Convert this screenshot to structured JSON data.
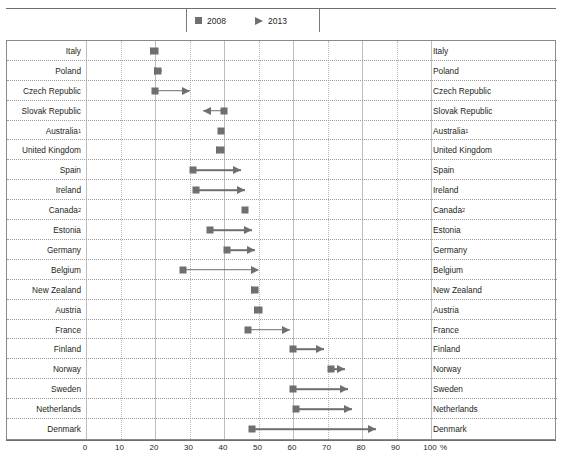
{
  "title": "",
  "legend": {
    "items": [
      {
        "label": "2008",
        "marker": "square-marker",
        "color": "#6f6f6f"
      },
      {
        "label": "2013",
        "marker": "triangle-marker",
        "color": "#6f6f6f"
      }
    ]
  },
  "axis": {
    "unit_label": "%",
    "ticks": [
      "0",
      "10",
      "20",
      "30",
      "40",
      "50",
      "60",
      "70",
      "80",
      "90",
      "100"
    ]
  },
  "chart_data": {
    "type": "bar",
    "subtype": "dumbbell-arrow-range",
    "title": "",
    "xlabel": "%",
    "ylabel": "",
    "xlim": [
      0,
      100
    ],
    "xticks": [
      0,
      10,
      20,
      30,
      40,
      50,
      60,
      70,
      80,
      90,
      100
    ],
    "grid": "vertical-dotted",
    "legend_position": "top-center",
    "categories": [
      "Italy",
      "Poland",
      "Czech Republic",
      "Slovak Republic",
      "Australia¹",
      "United Kingdom",
      "Spain",
      "Ireland",
      "Canada²",
      "Estonia",
      "Germany",
      "Belgium",
      "New Zealand",
      "Austria",
      "France",
      "Finland",
      "Norway",
      "Sweden",
      "Netherlands",
      "Denmark"
    ],
    "series": [
      {
        "name": "2008",
        "marker": "square",
        "values": [
          20,
          21,
          20,
          40,
          39,
          39,
          31,
          32,
          46,
          36,
          41,
          28,
          49,
          50,
          47,
          60,
          71,
          60,
          61,
          48
        ]
      },
      {
        "name": "2013",
        "marker": "triangle",
        "values": [
          21,
          22,
          30,
          34,
          null,
          40,
          45,
          46,
          null,
          48,
          49,
          50,
          50,
          51,
          59,
          69,
          75,
          76,
          77,
          84
        ]
      }
    ]
  },
  "rows": [
    {
      "label": "Italy",
      "sup": "",
      "v2008": 20,
      "v2013": 21,
      "direction": "right"
    },
    {
      "label": "Poland",
      "sup": "",
      "v2008": 21,
      "v2013": 22,
      "direction": "right"
    },
    {
      "label": "Czech Republic",
      "sup": "",
      "v2008": 20,
      "v2013": 30,
      "direction": "right"
    },
    {
      "label": "Slovak Republic",
      "sup": "",
      "v2008": 40,
      "v2013": 34,
      "direction": "left"
    },
    {
      "label": "Australia",
      "sup": "1",
      "v2008": 39,
      "v2013": null,
      "direction": "none"
    },
    {
      "label": "United Kingdom",
      "sup": "",
      "v2008": 39,
      "v2013": 40,
      "direction": "right"
    },
    {
      "label": "Spain",
      "sup": "",
      "v2008": 31,
      "v2013": 45,
      "direction": "right"
    },
    {
      "label": "Ireland",
      "sup": "",
      "v2008": 32,
      "v2013": 46,
      "direction": "right"
    },
    {
      "label": "Canada",
      "sup": "2",
      "v2008": 46,
      "v2013": null,
      "direction": "none"
    },
    {
      "label": "Estonia",
      "sup": "",
      "v2008": 36,
      "v2013": 48,
      "direction": "right"
    },
    {
      "label": "Germany",
      "sup": "",
      "v2008": 41,
      "v2013": 49,
      "direction": "right"
    },
    {
      "label": "Belgium",
      "sup": "",
      "v2008": 28,
      "v2013": 50,
      "direction": "right"
    },
    {
      "label": "New Zealand",
      "sup": "",
      "v2008": 49,
      "v2013": 50,
      "direction": "right"
    },
    {
      "label": "Austria",
      "sup": "",
      "v2008": 50,
      "v2013": 51,
      "direction": "right"
    },
    {
      "label": "France",
      "sup": "",
      "v2008": 47,
      "v2013": 59,
      "direction": "right"
    },
    {
      "label": "Finland",
      "sup": "",
      "v2008": 60,
      "v2013": 69,
      "direction": "right"
    },
    {
      "label": "Norway",
      "sup": "",
      "v2008": 71,
      "v2013": 75,
      "direction": "right"
    },
    {
      "label": "Sweden",
      "sup": "",
      "v2008": 60,
      "v2013": 76,
      "direction": "right"
    },
    {
      "label": "Netherlands",
      "sup": "",
      "v2008": 61,
      "v2013": 77,
      "direction": "right"
    },
    {
      "label": "Denmark",
      "sup": "",
      "v2008": 48,
      "v2013": 84,
      "direction": "right"
    }
  ]
}
